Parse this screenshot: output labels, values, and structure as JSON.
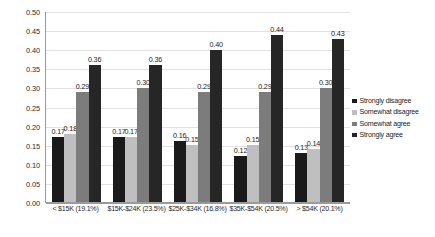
{
  "chart_data": {
    "type": "bar",
    "title": "",
    "xlabel": "",
    "ylabel": "Proportion",
    "ylim": [
      0.0,
      0.5
    ],
    "ytick_step": 0.05,
    "grid": true,
    "legend_position": "right",
    "categories": [
      "< $15K (19.1%)",
      "$15K-$24K (23.5%)",
      "$25K-$34K (16.8%)",
      "$35K-$54K (20.5%)",
      "> $54K (20.1%)"
    ],
    "ytick_labels": [
      "0.00",
      "0.05",
      "0.10",
      "0.15",
      "0.20",
      "0.25",
      "0.30",
      "0.35",
      "0.40",
      "0.45",
      "0.50"
    ],
    "series": [
      {
        "name": "Strongly disagree",
        "color": "#1a1a1a",
        "values": [
          0.17,
          0.17,
          0.16,
          0.12,
          0.13
        ],
        "labels": [
          "0.17",
          "0.17",
          "0.16",
          "0.12",
          "0.13"
        ]
      },
      {
        "name": "Somewhat disagree",
        "color": "#bfbfbf",
        "values": [
          0.18,
          0.17,
          0.15,
          0.15,
          0.14
        ],
        "labels": [
          "0.18",
          "0.17",
          "0.15",
          "0.15",
          "0.14"
        ]
      },
      {
        "name": "Somewhat agree",
        "color": "#7c7c7c",
        "values": [
          0.29,
          0.3,
          0.29,
          0.29,
          0.3
        ],
        "labels": [
          "0.29",
          "0.30",
          "0.29",
          "0.29",
          "0.30"
        ]
      },
      {
        "name": "Strongly agree",
        "color": "#262626",
        "values": [
          0.36,
          0.36,
          0.4,
          0.44,
          0.43
        ],
        "labels": [
          "0.36",
          "0.36",
          "0.40",
          "0.44",
          "0.43"
        ]
      }
    ]
  }
}
